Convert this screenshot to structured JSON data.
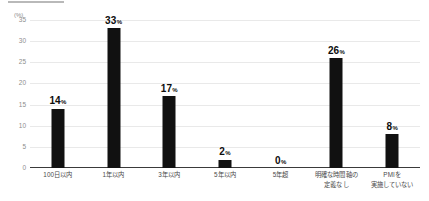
{
  "cutoff_row": {
    "fragments": [
      "",
      "",
      "",
      ""
    ]
  },
  "chart_data": {
    "type": "bar",
    "title": "",
    "subtitle": "",
    "xlabel": "",
    "ylabel": "",
    "unit_label": "(%)",
    "ylim": [
      0,
      35
    ],
    "ytick_step": 5,
    "yticks": [
      "0",
      "5",
      "10",
      "15",
      "20",
      "25",
      "30",
      "35"
    ],
    "grid": true,
    "legend": "none",
    "bar_color": "#111111",
    "grid_color": "#e9e9e9",
    "axis_color": "#3a3a3a",
    "value_suffix": "%",
    "categories": [
      "100日以内",
      "1年以内",
      "3年以内",
      "5年以内",
      "5年超",
      "明確な時間軸の\n定義なし",
      "PMIを\n実施していない"
    ],
    "category_lines": [
      [
        "100日以内"
      ],
      [
        "1年以内"
      ],
      [
        "3年以内"
      ],
      [
        "5年以内"
      ],
      [
        "5年超"
      ],
      [
        "明確な時間軸の",
        "定義なし"
      ],
      [
        "PMIを",
        "実施していない"
      ]
    ],
    "values": [
      14,
      33,
      17,
      2,
      0,
      26,
      8
    ],
    "value_labels": [
      "14",
      "33",
      "17",
      "2",
      "0",
      "26",
      "8"
    ]
  }
}
